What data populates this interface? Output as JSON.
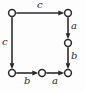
{
  "diagram": {
    "type": "labeled-transition-diagram",
    "background_color": "#fdfdfd",
    "stroke_color": "#2b2b2b",
    "node_fill_color": "#ffffff",
    "nodes": [
      {
        "id": "n-top-left",
        "name": "node-top-left",
        "x": 12,
        "y": 13,
        "r": 3.4
      },
      {
        "id": "n-top-right",
        "name": "node-top-right",
        "x": 68,
        "y": 13,
        "r": 3.4
      },
      {
        "id": "n-mid-right",
        "name": "node-mid-right",
        "x": 68,
        "y": 43,
        "r": 3.4
      },
      {
        "id": "n-bottom-left",
        "name": "node-bottom-left",
        "x": 12,
        "y": 73,
        "r": 3.4
      },
      {
        "id": "n-bottom-mid",
        "name": "node-bottom-mid",
        "x": 42,
        "y": 73,
        "r": 3.4
      },
      {
        "id": "n-bottom-right",
        "name": "node-bottom-right",
        "x": 68,
        "y": 73,
        "r": 3.4
      }
    ],
    "edges": [
      {
        "id": "e-top",
        "from": "n-top-left",
        "to": "n-top-right",
        "label": "c",
        "direction": "right",
        "label_x": 37,
        "label_y": 1
      },
      {
        "id": "e-left",
        "from": "n-top-left",
        "to": "n-bottom-left",
        "label": "c",
        "direction": "down",
        "label_x": 2,
        "label_y": 38
      },
      {
        "id": "e-right-upper",
        "from": "n-top-right",
        "to": "n-mid-right",
        "label": "a",
        "direction": "down",
        "label_x": 71,
        "label_y": 22
      },
      {
        "id": "e-right-lower",
        "from": "n-mid-right",
        "to": "n-bottom-right",
        "label": "b",
        "direction": "down",
        "label_x": 71,
        "label_y": 52
      },
      {
        "id": "e-bottom-left",
        "from": "n-bottom-left",
        "to": "n-bottom-mid",
        "label": "b",
        "direction": "right",
        "label_x": 24,
        "label_y": 77
      },
      {
        "id": "e-bottom-right",
        "from": "n-bottom-mid",
        "to": "n-bottom-right",
        "label": "a",
        "direction": "right",
        "label_x": 52,
        "label_y": 77
      }
    ],
    "labels": {
      "top": "c",
      "left": "c",
      "right_upper": "a",
      "right_lower": "b",
      "bottom_left": "b",
      "bottom_right": "a"
    }
  }
}
